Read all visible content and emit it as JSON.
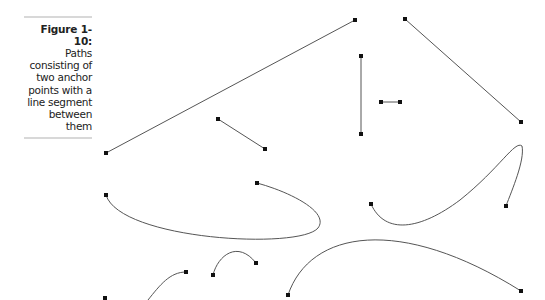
{
  "figure": {
    "label": "Figure 1-10:",
    "caption_lines": [
      "Paths",
      "consisting of",
      "two anchor",
      "points with a",
      "line segment",
      "between",
      "them"
    ]
  },
  "diagram": {
    "stroke_color": "#555555",
    "anchor_color": "#111111",
    "paths": [
      {
        "type": "straight",
        "d": "M106,153 L355,20",
        "anchors": [
          [
            106,
            153
          ],
          [
            355,
            20
          ]
        ]
      },
      {
        "type": "straight",
        "d": "M405,19 L521,122",
        "anchors": [
          [
            405,
            19
          ],
          [
            521,
            122
          ]
        ]
      },
      {
        "type": "straight",
        "d": "M361,56 L361,134",
        "anchors": [
          [
            361,
            56
          ],
          [
            361,
            134
          ]
        ]
      },
      {
        "type": "straight",
        "d": "M381,102 L400,102",
        "anchors": [
          [
            381,
            102
          ],
          [
            400,
            102
          ]
        ]
      },
      {
        "type": "straight",
        "d": "M218,119 L265,149",
        "anchors": [
          [
            218,
            119
          ],
          [
            265,
            149
          ]
        ]
      },
      {
        "type": "curve",
        "d": "M106,195 C120,240 300,250 318,228 C330,212 290,192 257,183",
        "anchors": [
          [
            106,
            195
          ],
          [
            257,
            183
          ]
        ]
      },
      {
        "type": "curve",
        "d": "M371,204 C385,235 420,230 460,200 C500,168 515,140 522,146 C525,160 512,190 506,206",
        "anchors": [
          [
            371,
            204
          ],
          [
            506,
            206
          ]
        ]
      },
      {
        "type": "curve",
        "d": "M213,275 C218,255 238,240 256,263",
        "anchors": [
          [
            213,
            275
          ],
          [
            256,
            263
          ]
        ]
      },
      {
        "type": "curve",
        "d": "M186,272 C170,272 160,285 148,300",
        "anchors": [
          [
            186,
            272
          ]
        ]
      },
      {
        "type": "point",
        "d": "",
        "anchors": [
          [
            105,
            298
          ]
        ]
      },
      {
        "type": "curve",
        "d": "M288,295 C310,230 400,215 521,291",
        "anchors": [
          [
            288,
            295
          ],
          [
            521,
            291
          ]
        ]
      }
    ]
  }
}
